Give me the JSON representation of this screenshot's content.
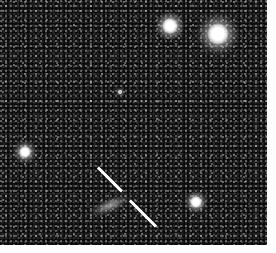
{
  "figure": {
    "kind": "astronomical-image",
    "caption": "",
    "field": {
      "x": 0,
      "y": 0,
      "width": 267,
      "height": 245,
      "background_color": "#050505",
      "noise_description": "fine pixel-scale grain, mostly black with scattered grey and white speckle"
    },
    "canvas": {
      "width": 276,
      "height": 253,
      "margin_color": "#fdfdfd"
    }
  },
  "stars": [
    {
      "name": "star-upper-middle",
      "cx": 170,
      "cy": 26,
      "core_radius": 8,
      "halo_radius": 17,
      "brightness": "bright",
      "color": "#ffffff"
    },
    {
      "name": "star-upper-right",
      "cx": 218,
      "cy": 34,
      "core_radius": 11,
      "halo_radius": 26,
      "brightness": "brightest",
      "color": "#ffffff"
    },
    {
      "name": "star-left",
      "cx": 25,
      "cy": 152,
      "core_radius": 6,
      "halo_radius": 15,
      "brightness": "medium",
      "color": "#ffffff"
    },
    {
      "name": "star-lower-right",
      "cx": 196,
      "cy": 202,
      "core_radius": 6,
      "halo_radius": 14,
      "brightness": "medium",
      "color": "#ffffff"
    },
    {
      "name": "star-faint-center",
      "cx": 120,
      "cy": 92,
      "core_radius": 2,
      "halo_radius": 6,
      "brightness": "faint",
      "color": "#c8c8c8"
    }
  ],
  "target_object": {
    "name": "diffuse-elongated-source",
    "cx": 110,
    "cy": 205,
    "length": 48,
    "thickness": 15,
    "rotation_deg": -22,
    "brightness": "faint-diffuse",
    "color": "#b4b4b4",
    "description": "faint elongated smudge flanked by two marker ticks"
  },
  "markers": [
    {
      "name": "marker-tick-upper-left",
      "x1": 98,
      "y1": 167,
      "x2": 122,
      "y2": 191,
      "thickness": 2.6,
      "color": "#ffffff"
    },
    {
      "name": "marker-tick-lower-right",
      "x1": 130,
      "y1": 200,
      "x2": 156,
      "y2": 226,
      "thickness": 2.6,
      "color": "#ffffff"
    }
  ]
}
